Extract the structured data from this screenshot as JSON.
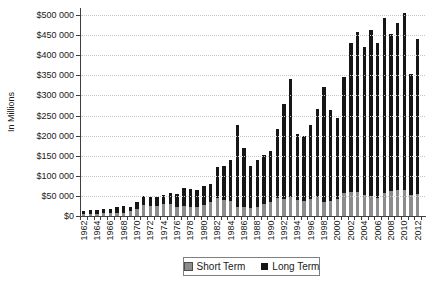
{
  "figure": {
    "background": "#ffffff",
    "y_axis_title": "In Millions"
  },
  "chart_data": {
    "type": "bar",
    "stacked": true,
    "title": "",
    "xlabel": "",
    "ylabel": "In Millions",
    "grid": {
      "horizontal": "dotted",
      "color": "#c6c6c6"
    },
    "legend_position": "bottom",
    "y_axis": {
      "min": 0,
      "max": 500000,
      "tick_interval": 50000,
      "tick_labels": [
        "$0",
        "$50 000",
        "$100 000",
        "$150 000",
        "$200 000",
        "$250 000",
        "$300 000",
        "$350 000",
        "$400 000",
        "$450 000",
        "$500 000"
      ]
    },
    "categories": [
      1962,
      1963,
      1964,
      1965,
      1966,
      1967,
      1968,
      1969,
      1970,
      1971,
      1972,
      1973,
      1974,
      1975,
      1976,
      1977,
      1978,
      1979,
      1980,
      1981,
      1982,
      1983,
      1984,
      1985,
      1986,
      1987,
      1988,
      1989,
      1990,
      1991,
      1992,
      1993,
      1994,
      1995,
      1996,
      1997,
      1998,
      1999,
      2000,
      2001,
      2002,
      2003,
      2004,
      2005,
      2006,
      2007,
      2008,
      2009,
      2010,
      2011,
      2012
    ],
    "x_tick_labels": [
      "1962",
      "1964",
      "1966",
      "1968",
      "1970",
      "1972",
      "1974",
      "1976",
      "1978",
      "1980",
      "1982",
      "1984",
      "1986",
      "1988",
      "1990",
      "1992",
      "1994",
      "1996",
      "1998",
      "2000",
      "2002",
      "2004",
      "2006",
      "2008",
      "2010",
      "2012"
    ],
    "series": [
      {
        "name": "Short Term",
        "color": "#8c8c8c",
        "values": [
          4500,
          5500,
          5500,
          6500,
          6500,
          8000,
          8600,
          11700,
          17900,
          26300,
          25200,
          24700,
          29000,
          29000,
          21900,
          24800,
          21400,
          21700,
          27700,
          34400,
          44300,
          39900,
          36600,
          22500,
          22500,
          21000,
          23600,
          29000,
          34800,
          44800,
          43000,
          47500,
          40100,
          38400,
          41700,
          46400,
          34700,
          36900,
          43400,
          57400,
          60000,
          60000,
          53000,
          50000,
          44100,
          58000,
          61000,
          64000,
          65000,
          52000,
          55000
        ]
      },
      {
        "name": "Long Term",
        "color": "#161616",
        "values": [
          8600,
          10100,
          10500,
          11100,
          11100,
          14300,
          16400,
          11500,
          17800,
          24400,
          22900,
          22700,
          22800,
          29300,
          33800,
          45100,
          46200,
          42300,
          47100,
          46100,
          77200,
          83300,
          101900,
          204300,
          147100,
          102400,
          114600,
          122600,
          126700,
          172300,
          234700,
          292500,
          165100,
          160000,
          185200,
          220700,
          286200,
          227500,
          200800,
          287700,
          370100,
          397100,
          367800,
          412500,
          386500,
          433700,
          392900,
          415200,
          439000,
          302100,
          386100
        ]
      }
    ]
  }
}
